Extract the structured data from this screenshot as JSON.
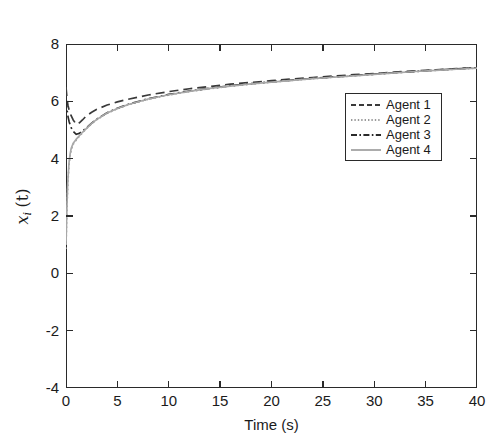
{
  "caption": {
    "cropped_text": "1                                        2"
  },
  "figure": {
    "ylabel_var": "x",
    "ylabel_sub": "i",
    "ylabel_paren": "(t)"
  },
  "legend": {
    "entries": [
      {
        "label": "Agent 1",
        "style": "dashed",
        "color": "#3a3a3a"
      },
      {
        "label": "Agent 2",
        "style": "dotted",
        "color": "#9a9a9a"
      },
      {
        "label": "Agent 3",
        "style": "dashdot",
        "color": "#2a2a2a"
      },
      {
        "label": "Agent 4",
        "style": "solid",
        "color": "#a8a8a8"
      }
    ]
  },
  "chart_data": {
    "type": "line",
    "title": "",
    "xlabel": "Time (s)",
    "ylabel": "x_i (t)",
    "xlim": [
      0,
      40
    ],
    "ylim": [
      -4,
      8
    ],
    "xticks": [
      0,
      5,
      10,
      15,
      20,
      25,
      30,
      35,
      40
    ],
    "yticks": [
      -4,
      -2,
      0,
      2,
      4,
      6,
      8
    ],
    "xticklabels": [
      "0",
      "5",
      "10",
      "15",
      "20",
      "25",
      "30",
      "35",
      "40"
    ],
    "yticklabels": [
      "-4",
      "-2",
      "0",
      "2",
      "4",
      "6",
      "8"
    ],
    "grid": false,
    "legend_position": "upper right",
    "x": [
      0,
      0.05,
      0.1,
      0.15,
      0.2,
      0.3,
      0.4,
      0.5,
      0.7,
      1.0,
      1.3,
      1.6,
      2.0,
      2.5,
      3.0,
      4.0,
      5.0,
      6.0,
      8.0,
      10.0,
      12.0,
      14.0,
      16.0,
      18.0,
      20.0,
      22.0,
      24.0,
      26.0,
      28.0,
      30.0,
      32.0,
      34.0,
      36.0,
      38.0,
      40.0
    ],
    "series": [
      {
        "name": "Agent 1",
        "style": "dashed",
        "color": "#3a3a3a",
        "values": [
          6.5,
          6.3,
          6.1,
          5.95,
          5.85,
          5.7,
          5.6,
          5.5,
          5.35,
          5.2,
          5.25,
          5.35,
          5.5,
          5.62,
          5.72,
          5.87,
          5.98,
          6.07,
          6.22,
          6.34,
          6.44,
          6.52,
          6.6,
          6.66,
          6.72,
          6.78,
          6.83,
          6.88,
          6.93,
          6.97,
          7.02,
          7.06,
          7.1,
          7.14,
          7.18
        ]
      },
      {
        "name": "Agent 2",
        "style": "dotted",
        "color": "#9a9a9a",
        "values": [
          0.85,
          1.6,
          2.3,
          2.85,
          3.25,
          3.8,
          4.1,
          4.3,
          4.5,
          4.65,
          4.78,
          4.9,
          5.05,
          5.22,
          5.36,
          5.58,
          5.74,
          5.87,
          6.07,
          6.22,
          6.34,
          6.44,
          6.53,
          6.6,
          6.67,
          6.73,
          6.79,
          6.84,
          6.89,
          6.94,
          6.99,
          7.04,
          7.08,
          7.12,
          7.16
        ]
      },
      {
        "name": "Agent 3",
        "style": "dashdot",
        "color": "#2a2a2a",
        "values": [
          6.1,
          5.9,
          5.72,
          5.58,
          5.46,
          5.3,
          5.18,
          5.08,
          4.95,
          4.85,
          4.88,
          4.96,
          5.08,
          5.24,
          5.38,
          5.6,
          5.76,
          5.89,
          6.09,
          6.24,
          6.36,
          6.46,
          6.54,
          6.62,
          6.68,
          6.74,
          6.8,
          6.85,
          6.9,
          6.95,
          7.0,
          7.04,
          7.09,
          7.13,
          7.17
        ]
      },
      {
        "name": "Agent 4",
        "style": "solid",
        "color": "#a8a8a8",
        "values": [
          1.0,
          1.75,
          2.45,
          2.98,
          3.36,
          3.88,
          4.16,
          4.35,
          4.54,
          4.68,
          4.8,
          4.92,
          5.06,
          5.23,
          5.37,
          5.59,
          5.75,
          5.88,
          6.08,
          6.23,
          6.35,
          6.45,
          6.53,
          6.61,
          6.67,
          6.73,
          6.79,
          6.84,
          6.89,
          6.94,
          6.99,
          7.04,
          7.08,
          7.12,
          7.16
        ]
      }
    ],
    "annotations": [
      "All four agents converge to a common trajectory by t approx 2 s, then increase slowly toward about 7.2 at t = 40 s."
    ]
  }
}
